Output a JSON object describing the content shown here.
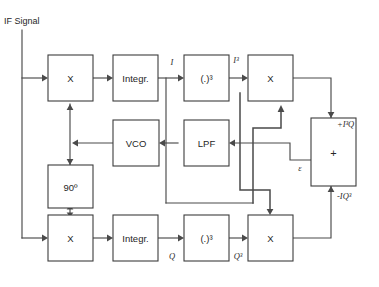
{
  "diagram": {
    "input_label": "IF Signal",
    "blocks": {
      "mixer_i": "X",
      "integrator_i": "Integr.",
      "cube_i": "(.)³",
      "crossmult_i": "X",
      "vco": "VCO",
      "lpf": "LPF",
      "adder": "+",
      "phase_shift": "90º",
      "mixer_q": "X",
      "integrator_q": "Integr.",
      "cube_q": "(.)³",
      "crossmult_q": "X"
    },
    "signals": {
      "i": "I",
      "i_cubed": "I³",
      "q": "Q",
      "q_cubed": "Q³",
      "adder_in_top": "+I³Q",
      "adder_in_bottom": "-IQ³",
      "error": "ε"
    },
    "colors": {
      "background": "#ffffff",
      "block_stroke": "#3c3c3c",
      "wire": "#4a4a4a",
      "text": "#262626"
    }
  }
}
